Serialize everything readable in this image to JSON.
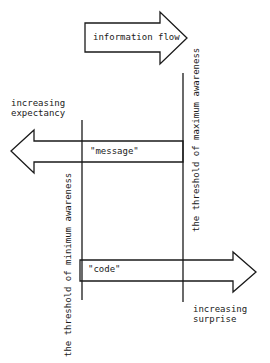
{
  "diagram": {
    "top_arrow": {
      "label": "information flow",
      "direction": "right"
    },
    "left_annotation": {
      "line1": "increasing",
      "line2": "expectancy"
    },
    "right_annotation": {
      "line1": "increasing",
      "line2": "surprise"
    },
    "message_arrow": {
      "label": "\"message\"",
      "direction": "left"
    },
    "code_arrow": {
      "label": "\"code\"",
      "direction": "right"
    },
    "min_threshold": {
      "label": "the threshold of minimum awareness"
    },
    "max_threshold": {
      "label": "the threshold of maximum awareness"
    },
    "colors": {
      "stroke": "#1a1a1a",
      "background": "#ffffff"
    }
  }
}
